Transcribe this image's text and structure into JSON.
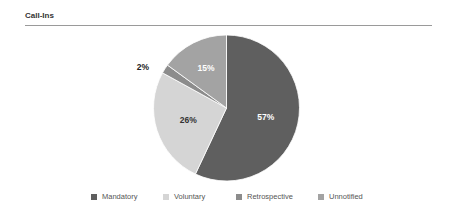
{
  "chart_data": {
    "type": "pie",
    "title": "Call-Ins",
    "categories": [
      "Mandatory",
      "Voluntary",
      "Retrospective",
      "Unnotified"
    ],
    "values": [
      57,
      26,
      2,
      15
    ],
    "labels": [
      "57%",
      "26%",
      "2%",
      "15%"
    ],
    "colors": [
      "#5f5f5f",
      "#d5d5d5",
      "#8c8c8c",
      "#a3a3a3"
    ],
    "start_angle_deg": 0,
    "direction": "clockwise",
    "legend_position": "bottom"
  },
  "header": {
    "title": "Call-Ins"
  },
  "legend": [
    {
      "label": "Mandatory",
      "color": "#5f5f5f"
    },
    {
      "label": "Voluntary",
      "color": "#d5d5d5"
    },
    {
      "label": "Retrospective",
      "color": "#8c8c8c"
    },
    {
      "label": "Unnotified",
      "color": "#a3a3a3"
    }
  ]
}
